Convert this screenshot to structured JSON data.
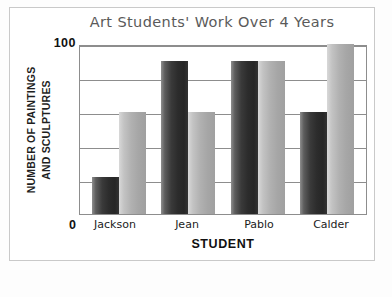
{
  "chart_data": {
    "type": "bar",
    "title": "Art Students' Work Over 4 Years",
    "xlabel": "STUDENT",
    "ylabel_line1": "NUMBER OF PAINTINGS",
    "ylabel_line2": "AND SCULPTURES",
    "categories": [
      "Jackson",
      "Jean",
      "Pablo",
      "Calder"
    ],
    "ylim": [
      0,
      100
    ],
    "ytick_labels": [
      "0",
      "100"
    ],
    "gridlines": [
      20,
      40,
      60,
      80,
      100
    ],
    "grid": true,
    "legend": "none",
    "series": [
      {
        "name": "paintings",
        "color": "#2c2c2c",
        "values": [
          22,
          90,
          90,
          60
        ]
      },
      {
        "name": "sculptures",
        "color": "#b1b1b1",
        "values": [
          60,
          60,
          90,
          100
        ]
      }
    ]
  },
  "axis": {
    "top_tick": "100",
    "bottom_tick": "0"
  }
}
